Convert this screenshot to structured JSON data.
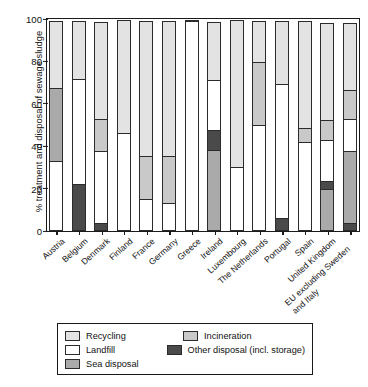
{
  "chart_data": {
    "type": "bar",
    "subtype": "stacked-bar-100-percent",
    "title": "",
    "xlabel": "",
    "ylabel": "% treatment and disposal of sewage sludge",
    "ylim": [
      0,
      100
    ],
    "yticks": [
      0,
      20,
      40,
      60,
      80,
      100
    ],
    "ytick_labels": [
      "0",
      "20",
      "40",
      "60",
      "80",
      "100"
    ],
    "grid": false,
    "legend_position": "below-axes",
    "categories": [
      "Austria",
      "Belgium",
      "Denmark",
      "Finland",
      "France",
      "Germany",
      "Greece",
      "Ireland",
      "Luxembourg",
      "The Netherlands",
      "Portugal",
      "Spain",
      "United Kingdom",
      "EU excluding Sweden and Italy"
    ],
    "series": [
      {
        "name": "Landfill",
        "color": "#ffffff",
        "values": [
          33,
          50,
          34,
          46,
          15,
          13,
          99,
          24,
          30,
          50,
          64,
          42,
          20,
          16
        ]
      },
      {
        "name": "Sea disposal",
        "color": "#aaaaaa",
        "values": [
          35,
          0,
          0,
          0,
          0,
          0,
          0,
          38,
          0,
          0,
          0,
          0,
          20,
          34
        ]
      },
      {
        "name": "Incineration",
        "color": "#c9c9c9",
        "values": [
          0,
          0,
          16,
          0,
          21,
          23,
          0,
          0,
          0,
          30,
          0,
          7,
          10,
          14
        ]
      },
      {
        "name": "Other disposal (incl. storage)",
        "color": "#4a4a4a",
        "values": [
          0,
          22,
          4,
          0,
          0,
          0,
          0,
          10,
          0,
          0,
          6,
          0,
          4,
          4
        ]
      },
      {
        "name": "Recycling",
        "color": "#e3e3e3",
        "values": [
          32,
          28,
          46,
          54,
          64,
          64,
          1,
          28,
          70,
          20,
          30,
          51,
          46,
          32
        ]
      }
    ],
    "stack_order_bottom_to_top": {
      "Austria": [
        "Landfill",
        "Sea disposal",
        "Recycling"
      ],
      "Belgium": [
        "Other disposal (incl. storage)",
        "Landfill",
        "Recycling"
      ],
      "Denmark": [
        "Other disposal (incl. storage)",
        "Landfill",
        "Incineration",
        "Recycling"
      ],
      "Finland": [
        "Landfill",
        "Recycling"
      ],
      "France": [
        "Landfill",
        "Incineration",
        "Recycling"
      ],
      "Germany": [
        "Landfill",
        "Incineration",
        "Recycling"
      ],
      "Greece": [
        "Landfill",
        "Recycling"
      ],
      "Ireland": [
        "Sea disposal",
        "Other disposal (incl. storage)",
        "Landfill",
        "Recycling"
      ],
      "Luxembourg": [
        "Landfill",
        "Recycling"
      ],
      "The Netherlands": [
        "Landfill",
        "Incineration",
        "Recycling"
      ],
      "Portugal": [
        "Other disposal (incl. storage)",
        "Landfill",
        "Recycling"
      ],
      "Spain": [
        "Landfill",
        "Incineration",
        "Recycling"
      ],
      "United Kingdom": [
        "Sea disposal",
        "Other disposal (incl. storage)",
        "Landfill",
        "Incineration",
        "Recycling"
      ],
      "EU excluding Sweden and Italy": [
        "Other disposal (incl. storage)",
        "Sea disposal",
        "Landfill",
        "Incineration",
        "Recycling"
      ]
    }
  },
  "legend": {
    "rows": [
      {
        "left": {
          "label": "Recycling",
          "color": "#e3e3e3"
        },
        "right": {
          "label": "Incineration",
          "color": "#c9c9c9"
        }
      },
      {
        "left": {
          "label": "Landfill",
          "color": "#ffffff"
        },
        "right": {
          "label": "Other disposal (incl. storage)",
          "color": "#4a4a4a"
        }
      },
      {
        "left": {
          "label": "Sea disposal",
          "color": "#aaaaaa"
        },
        "right": {
          "label": "",
          "color": ""
        }
      }
    ]
  }
}
